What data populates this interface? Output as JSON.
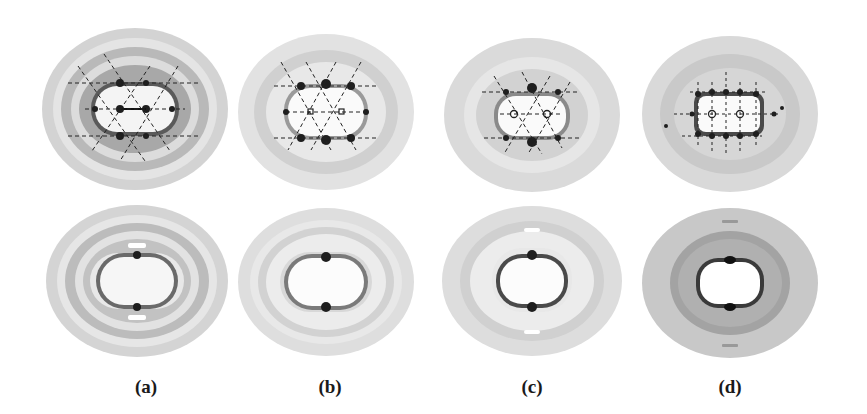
{
  "figure": {
    "columns": [
      {
        "label": "(a)",
        "center_x": 146
      },
      {
        "label": "(b)",
        "center_x": 330
      },
      {
        "label": "(c)",
        "center_x": 532
      },
      {
        "label": "(d)",
        "center_x": 730
      }
    ],
    "rows": [
      "top: diffraction patterns with dashed lattice overlay and circular markers",
      "bottom: smoothed ring patterns"
    ],
    "colors": {
      "background": "#ffffff",
      "light_gray": "#e6e6e6",
      "mid_gray": "#c4c4c4",
      "dark_gray": "#9a9a9a",
      "spot": "#1e1e1e",
      "dashed_line": "#222222"
    }
  }
}
